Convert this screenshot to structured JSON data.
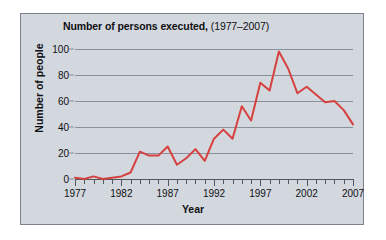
{
  "chart_data": {
    "type": "line",
    "title": "Number of persons executed, (1977–2007)",
    "title_main": "Number of persons executed,",
    "title_sub": "(1977–2007)",
    "xlabel": "Year",
    "ylabel": "Number of people",
    "xlim": [
      1977,
      2007
    ],
    "ylim": [
      0,
      100
    ],
    "grid": true,
    "legend": "none",
    "line_color": "#d6413f",
    "gridline_color": "#8a8f9c",
    "background_color": "#d3d8de",
    "x": [
      1977,
      1978,
      1979,
      1980,
      1981,
      1982,
      1983,
      1984,
      1985,
      1986,
      1987,
      1988,
      1989,
      1990,
      1991,
      1992,
      1993,
      1994,
      1995,
      1996,
      1997,
      1998,
      1999,
      2000,
      2001,
      2002,
      2003,
      2004,
      2005,
      2006,
      2007
    ],
    "values": [
      1,
      0,
      2,
      0,
      1,
      2,
      5,
      21,
      18,
      18,
      25,
      11,
      16,
      23,
      14,
      31,
      38,
      31,
      56,
      45,
      74,
      68,
      98,
      85,
      66,
      71,
      65,
      59,
      60,
      53,
      42
    ],
    "ytick_labels": [
      "0",
      "20",
      "40",
      "60",
      "80",
      "100"
    ],
    "ytick_values": [
      0,
      20,
      40,
      60,
      80,
      100
    ],
    "xtick_labels": [
      "1977",
      "1982",
      "1987",
      "1992",
      "1997",
      "2002",
      "2007"
    ],
    "xtick_values": [
      1977,
      1982,
      1987,
      1992,
      1997,
      2002,
      2007
    ],
    "xminor_step": 1
  }
}
